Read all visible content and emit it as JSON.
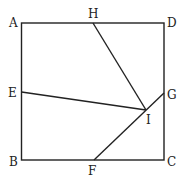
{
  "diagram": {
    "type": "geometry-square",
    "points": {
      "A": {
        "label": "A",
        "x": 22,
        "y": 23
      },
      "D": {
        "label": "D",
        "x": 164,
        "y": 23
      },
      "B": {
        "label": "B",
        "x": 21,
        "y": 160
      },
      "C": {
        "label": "C",
        "x": 164,
        "y": 160
      },
      "H": {
        "label": "H",
        "x": 93,
        "y": 23
      },
      "E": {
        "label": "E",
        "x": 21,
        "y": 92
      },
      "G": {
        "label": "G",
        "x": 164,
        "y": 93
      },
      "F": {
        "label": "F",
        "x": 94,
        "y": 160
      },
      "I": {
        "label": "I",
        "x": 146,
        "y": 110
      }
    },
    "segments": [
      [
        "A",
        "D"
      ],
      [
        "D",
        "C"
      ],
      [
        "C",
        "B"
      ],
      [
        "B",
        "A"
      ],
      [
        "H",
        "I"
      ],
      [
        "E",
        "I"
      ],
      [
        "F",
        "G"
      ]
    ]
  }
}
